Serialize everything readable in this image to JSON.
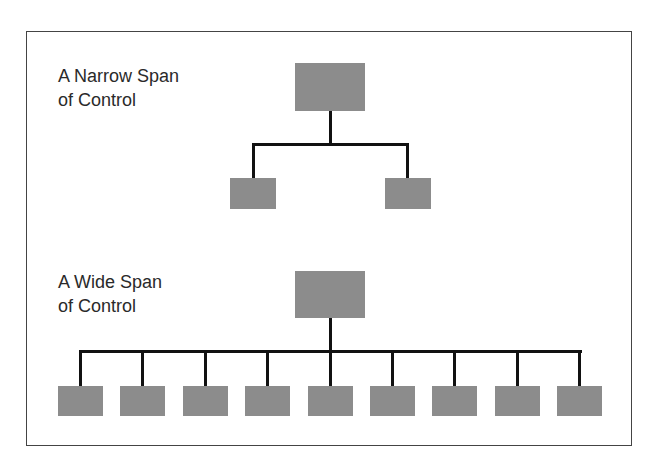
{
  "diagrams": [
    {
      "title_line1": "A Narrow Span",
      "title_line2": "of Control",
      "subordinate_count": 2
    },
    {
      "title_line1": "A Wide Span",
      "title_line2": "of Control",
      "subordinate_count": 9
    }
  ],
  "colors": {
    "box": "#8c8c8c",
    "line": "#111111",
    "frame": "#444444",
    "text": "#2a2a2a"
  }
}
